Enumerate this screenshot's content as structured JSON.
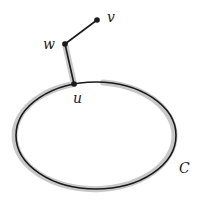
{
  "diagram": {
    "type": "graph",
    "nodes": [
      {
        "id": "v",
        "label": "v",
        "x": 97,
        "y": 20
      },
      {
        "id": "w",
        "label": "w",
        "x": 65,
        "y": 44
      },
      {
        "id": "u",
        "label": "u",
        "x": 74,
        "y": 84
      }
    ],
    "edges": [
      {
        "from": "w",
        "to": "v",
        "highlighted": false
      },
      {
        "from": "w",
        "to": "u",
        "highlighted": true
      }
    ],
    "cycle": {
      "label": "C",
      "cx": 96,
      "cy": 135.5,
      "rx": 80,
      "ry": 53.5,
      "highlighted_except_gap_near": "u"
    },
    "colors": {
      "line": "#1a1a1a",
      "highlight": "#c8c8c8"
    }
  }
}
